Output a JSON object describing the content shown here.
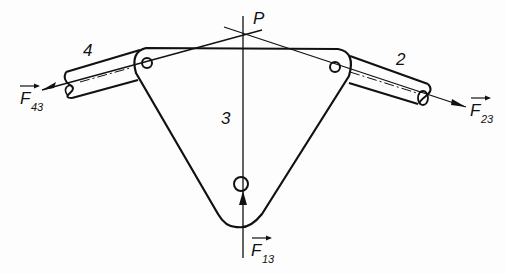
{
  "diagram": {
    "type": "free-body diagram of three-force member",
    "labels": {
      "point": "P",
      "link_left": "4",
      "link_right": "2",
      "plate": "3"
    },
    "forces": [
      {
        "name": "F",
        "subscript": "43",
        "direction": "left, along link 4"
      },
      {
        "name": "F",
        "subscript": "23",
        "direction": "right, along link 2"
      },
      {
        "name": "F",
        "subscript": "13",
        "direction": "up, vertical"
      }
    ],
    "colors": {
      "stroke": "#111111",
      "background": "#fdfdfd"
    }
  }
}
